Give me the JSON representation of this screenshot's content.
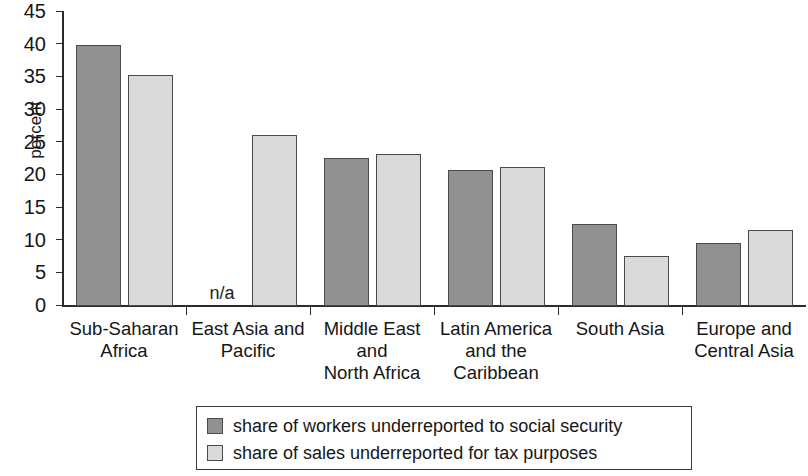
{
  "chart_data": {
    "type": "bar",
    "title": "",
    "xlabel": "",
    "ylabel": "percent",
    "ylim": [
      0,
      45
    ],
    "ytick_step": 5,
    "yticks": [
      "45",
      "40",
      "35",
      "30",
      "25",
      "20",
      "15",
      "10",
      "5",
      "0"
    ],
    "grid": false,
    "legend_position": "bottom",
    "categories": [
      "Sub-Saharan Africa",
      "East Asia and Pacific",
      "Middle East and North Africa",
      "Latin America and the Caribbean",
      "South Asia",
      "Europe and Central Asia"
    ],
    "category_label_lines": [
      [
        "Sub-Saharan",
        "Africa"
      ],
      [
        "East Asia and",
        "Pacific"
      ],
      [
        "Middle East",
        "and",
        "North Africa"
      ],
      [
        "Latin America",
        "and the",
        "Caribbean"
      ],
      [
        "South Asia"
      ],
      [
        "Europe and",
        "Central Asia"
      ]
    ],
    "series": [
      {
        "name": "share of workers underreported to social security",
        "color": "#919191",
        "values": [
          40.0,
          null,
          22.7,
          20.8,
          12.5,
          9.6
        ],
        "missing_label": "n/a"
      },
      {
        "name": "share of sales underreported for tax purposes",
        "color": "#dadada",
        "values": [
          35.4,
          26.1,
          23.3,
          21.3,
          7.6,
          11.6
        ]
      }
    ]
  },
  "legend": {
    "items": [
      "share of workers underreported to social security",
      "share of sales underreported for tax purposes"
    ]
  },
  "annotations": {
    "na_text": "n/a"
  }
}
